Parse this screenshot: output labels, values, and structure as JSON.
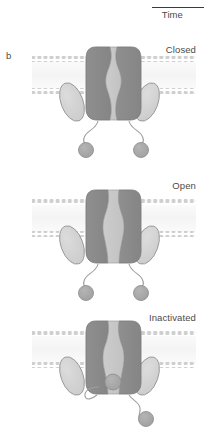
{
  "figure": {
    "panel_letter": "b",
    "time_axis": {
      "label": "Time"
    },
    "subunit_labels": {
      "alpha": "α",
      "beta": "β"
    },
    "colors": {
      "alpha_subunit": "#8c8c8c",
      "alpha_subunit_dark": "#838383",
      "pore_lumen": "#c9c9c9",
      "beta_subunit": "#d3d3d3",
      "inactivation_ball": "#a8a8a8",
      "membrane_lipid": "#cfcfcf",
      "membrane_interior": "#f2f2f2",
      "outline": "#8a8a8a",
      "text": "#4a4a4a"
    },
    "states": [
      {
        "id": "closed",
        "label": "Closed",
        "pore_state": "closed",
        "ball_positions": "both balls tethered below membrane, unbound"
      },
      {
        "id": "open",
        "label": "Open",
        "pore_state": "open",
        "ball_positions": "both balls tethered below membrane, unbound"
      },
      {
        "id": "inactivated",
        "label": "Inactivated",
        "pore_state": "blocked by inactivation ball",
        "ball_positions": "left ball plugs pore mouth, right ball dangles free"
      }
    ]
  }
}
